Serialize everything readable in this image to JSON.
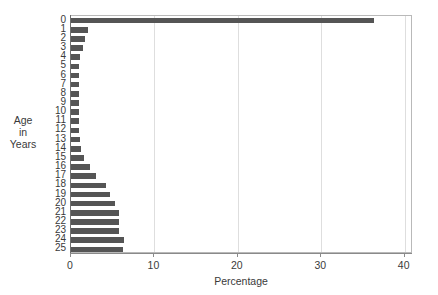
{
  "chart_data": {
    "type": "bar",
    "orientation": "horizontal",
    "title": "",
    "xlabel": "Percentage",
    "ylabel": "Age\nin\nYears",
    "ylabel_lines": [
      "Age",
      "in",
      "Years"
    ],
    "categories": [
      "0",
      "1",
      "2",
      "3",
      "4",
      "5",
      "6",
      "7",
      "8",
      "9",
      "10",
      "11",
      "12",
      "13",
      "14",
      "15",
      "16",
      "17",
      "18",
      "19",
      "20",
      "21",
      "22",
      "23",
      "24",
      "25"
    ],
    "values": [
      36.3,
      2.0,
      1.7,
      1.4,
      1.1,
      1.0,
      1.0,
      1.0,
      1.0,
      1.0,
      1.0,
      1.0,
      1.0,
      1.1,
      1.2,
      1.5,
      2.3,
      3.0,
      4.2,
      4.7,
      5.3,
      5.8,
      5.8,
      5.8,
      6.3,
      6.2
    ],
    "xlim": [
      0,
      41
    ],
    "xticks": [
      0,
      10,
      20,
      30,
      40
    ],
    "xtick_labels": [
      "0",
      "10",
      "20",
      "30",
      "40"
    ],
    "grid": "vertical",
    "gridlines_at": [
      10,
      20,
      30,
      40
    ],
    "legend": null,
    "bar_color": "#555555",
    "frame_color": "#b9b9b9",
    "axis_color": "#6f6f6f",
    "grid_color": "#dedede",
    "background": "#ffffff"
  }
}
